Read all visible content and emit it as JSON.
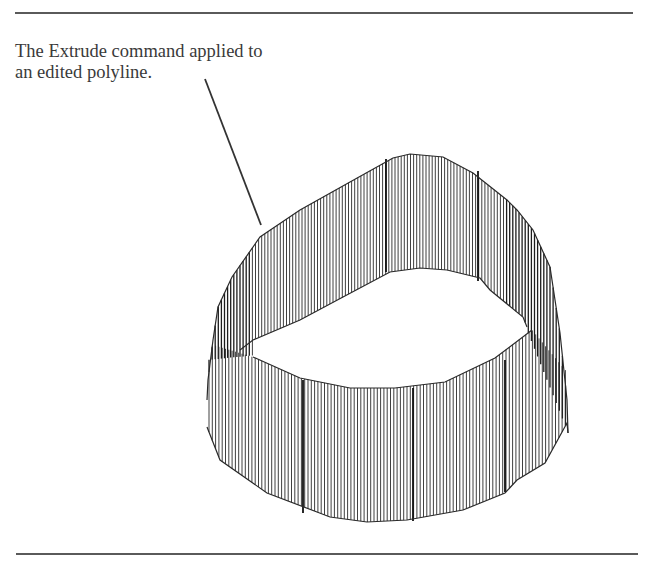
{
  "document": {
    "caption": {
      "line1": "The Extrude command applied to",
      "line2": "an edited polyline."
    },
    "figure": {
      "subject": "extruded-polyline-wireframe",
      "stroke_color": "#2a2a2a",
      "leader_color": "#333333",
      "rule_color": "#5a5a5a"
    }
  }
}
